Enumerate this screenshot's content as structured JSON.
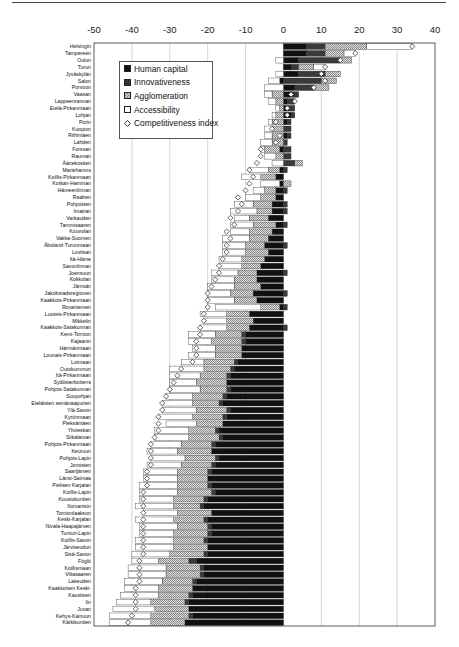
{
  "chart_data": {
    "type": "bar",
    "orientation": "horizontal",
    "stacked": true,
    "title": "",
    "xlabel": "",
    "ylabel": "",
    "xlim": [
      -50,
      40
    ],
    "x_ticks": [
      -50,
      -40,
      -30,
      -20,
      -10,
      0,
      10,
      20,
      30,
      40
    ],
    "grid": true,
    "legend_position": "upper left inside",
    "legend": [
      "Human capital",
      "Innovativeness",
      "Agglomeration",
      "Accessibility",
      "Competitiveness index"
    ],
    "colors": {
      "human_capital": "#111111",
      "innovativeness": "#3a3a3a",
      "agglomeration": "#bdbdbd",
      "accessibility": "#ffffff",
      "index_marker": "#ffffff"
    },
    "categories": [
      "Helsingin",
      "Tampereen",
      "Oulun",
      "Turun",
      "Jyväskylän",
      "Salon",
      "Porvoon",
      "Vaasan",
      "Lappeenrannan",
      "Etelä-Pirkanmaan",
      "Lohjan",
      "Porin",
      "Kuopion",
      "Riihimäen",
      "Lahden",
      "Forssan",
      "Rauman",
      "Äänekosken",
      "Mariehamns",
      "Koillis-Pirkanmaan",
      "Kotkan-Haminan",
      "Hämeenlinnan",
      "Raahen",
      "Pohjoisten",
      "Imatran",
      "Varkauden",
      "Tammisaaren",
      "Kouvolan",
      "Vakka-Suomen",
      "Åboland-Turunmaan",
      "Loviisan",
      "Itä-Häme",
      "Savonlinnan",
      "Joensuun",
      "Kokkolan",
      "Jämsän",
      "Jakobstadsregionen",
      "Kaakkois-Pirkanmaan",
      "Rovaniemen",
      "Luoteis-Pirkanmaan",
      "Mikkelin",
      "Kaakkois-Satakunnan",
      "Kemi-Tornion",
      "Kajaanin",
      "Härmänmaan",
      "Lounais-Pirkanmaan",
      "Loimaan",
      "Outokummun",
      "Itä-Pirkanmaan",
      "Sydösterbottens",
      "Pohjois-Satakunnan",
      "Suupohjan",
      "Eteläisten seinänaapurien",
      "Ylä-Savon",
      "Kyrönmaan",
      "Pieksämäen",
      "Ylivieskan",
      "Siikalatvan",
      "Pohjois-Pirkanmaan",
      "Keuruun",
      "Pohjois-Lapin",
      "Joroisten",
      "Saarijärven",
      "Länsi-Saimaa",
      "Pielisen Karjalan",
      "Koillis-Lapin",
      "Kuusiokuntien",
      "Ilomantsin",
      "Tornionlaakson",
      "Keski-Karjalan",
      "Nivala-Haapajärven",
      "Tunturi-Lapin",
      "Koillis-Savon",
      "Järviseudun",
      "Sisä-Savon",
      "Föglö",
      "Koillismaan",
      "Viitasaaren",
      "Lakeuden",
      "Kaakkoisen Keski-",
      "Kaustisen",
      "Iin",
      "Juvan",
      "Kehys-Kainuun",
      "Kärkikuntien"
    ],
    "series": [
      {
        "name": "Human capital",
        "values": [
          6,
          6,
          4,
          2,
          4,
          -1,
          3,
          2,
          1,
          1,
          2,
          1,
          0,
          1,
          0,
          -1,
          0,
          0,
          -1,
          -2,
          -1,
          -2,
          -2,
          -3,
          -3,
          -4,
          -2,
          -3,
          -4,
          -5,
          -4,
          -5,
          -6,
          -7,
          -7,
          -6,
          -8,
          -7,
          -1,
          -9,
          -8,
          -9,
          -10,
          -10,
          -11,
          -11,
          -12,
          -13,
          -14,
          -15,
          -14,
          -15,
          -16,
          -14,
          -15,
          -16,
          -17,
          -16,
          -18,
          -19,
          -17,
          -18,
          -19,
          -20,
          -19,
          -18,
          -20,
          -21,
          -19,
          -20,
          -19,
          -19,
          -20,
          -20,
          -20,
          -23,
          -21,
          -21,
          -23,
          -24,
          -24,
          -25,
          -25,
          -24,
          -26
        ]
      },
      {
        "name": "Innovativeness",
        "values": [
          5,
          5,
          11,
          2,
          7,
          10,
          5,
          2,
          2,
          2,
          1,
          1,
          2,
          1,
          1,
          2,
          2,
          3,
          1,
          0,
          0,
          1,
          0,
          1,
          1,
          0,
          1,
          0,
          0,
          1,
          0,
          0,
          0,
          1,
          0,
          0,
          1,
          0,
          1,
          0,
          0,
          1,
          -1,
          -1,
          0,
          0,
          -1,
          -1,
          -1,
          0,
          -1,
          -1,
          -1,
          -1,
          -1,
          0,
          -1,
          -1,
          -1,
          0,
          -1,
          -1,
          -1,
          0,
          -1,
          -1,
          -1,
          -1,
          0,
          -1,
          -1,
          -1,
          -1,
          0,
          -1,
          -2,
          -1,
          -1,
          -1,
          0,
          -1,
          -1,
          0,
          -1,
          0
        ]
      },
      {
        "name": "Agglomeration",
        "values": [
          11,
          5,
          3,
          4,
          4,
          4,
          4,
          -3,
          -2,
          -1,
          -2,
          -3,
          -3,
          -3,
          -3,
          -4,
          -2,
          2,
          -3,
          -4,
          2,
          -3,
          -4,
          -5,
          -4,
          -5,
          -6,
          -6,
          -5,
          -5,
          -6,
          -6,
          -5,
          -5,
          -6,
          -7,
          -6,
          -6,
          -5,
          -6,
          -7,
          -6,
          -7,
          -8,
          -7,
          -7,
          -8,
          -7,
          -7,
          -8,
          -7,
          -8,
          -7,
          -8,
          -8,
          -7,
          -7,
          -8,
          -8,
          -9,
          -8,
          -8,
          -8,
          -8,
          -8,
          -9,
          -8,
          -7,
          -9,
          -8,
          -8,
          -9,
          -8,
          -9,
          -9,
          -8,
          -9,
          -9,
          -8,
          -9,
          -8,
          -9,
          -9,
          -10,
          -9
        ]
      },
      {
        "name": "Accessibility",
        "values": [
          12,
          3,
          -2,
          3,
          -2,
          -3,
          -5,
          -2,
          -2,
          -1,
          -1,
          -1,
          -2,
          -2,
          -3,
          -1,
          -3,
          -3,
          -5,
          -5,
          -5,
          -3,
          -4,
          -5,
          -7,
          -4,
          -6,
          -5,
          -7,
          -6,
          -6,
          -6,
          -6,
          -7,
          -6,
          -7,
          -6,
          -7,
          -12,
          -7,
          -6,
          -7,
          -7,
          -6,
          -6,
          -7,
          -6,
          -9,
          -8,
          -7,
          -8,
          -7,
          -8,
          -9,
          -9,
          -8,
          -9,
          -9,
          -8,
          -8,
          -9,
          -9,
          -9,
          -9,
          -10,
          -10,
          -9,
          -10,
          -9,
          -10,
          -10,
          -9,
          -10,
          -10,
          -10,
          -7,
          -10,
          -10,
          -10,
          -9,
          -10,
          -9,
          -11,
          -11,
          -11
        ]
      },
      {
        "name": "Competitiveness index",
        "type": "scatter",
        "values": [
          34,
          19,
          15,
          11,
          10,
          11,
          8,
          2,
          3,
          1,
          1,
          -2,
          -3,
          -1,
          -2,
          -6,
          -6,
          -7,
          -9,
          -8,
          -9,
          -10,
          -12,
          -11,
          -12,
          -14,
          -13,
          -15,
          -14,
          -15,
          -15,
          -16,
          -17,
          -17,
          -18,
          -19,
          -20,
          -20,
          -20,
          -21,
          -21,
          -22,
          -22,
          -23,
          -23,
          -23,
          -24,
          -27,
          -28,
          -29,
          -30,
          -31,
          -32,
          -32,
          -33,
          -33,
          -33,
          -34,
          -35,
          -35,
          -35,
          -35,
          -36,
          -36,
          -36,
          -37,
          -37,
          -37,
          -37,
          -37,
          -37,
          -37,
          -37,
          -37,
          -37,
          -38,
          -38,
          -38,
          -38,
          -39,
          -39,
          -39,
          -39,
          -40,
          -41
        ]
      }
    ]
  },
  "legend": {
    "items": [
      {
        "label": "Human capital",
        "key": "hc"
      },
      {
        "label": "Innovativeness",
        "key": "inn"
      },
      {
        "label": "Agglomeration",
        "key": "agg"
      },
      {
        "label": "Accessibility",
        "key": "acc"
      },
      {
        "label": "Competitiveness index",
        "key": "idx"
      }
    ]
  }
}
